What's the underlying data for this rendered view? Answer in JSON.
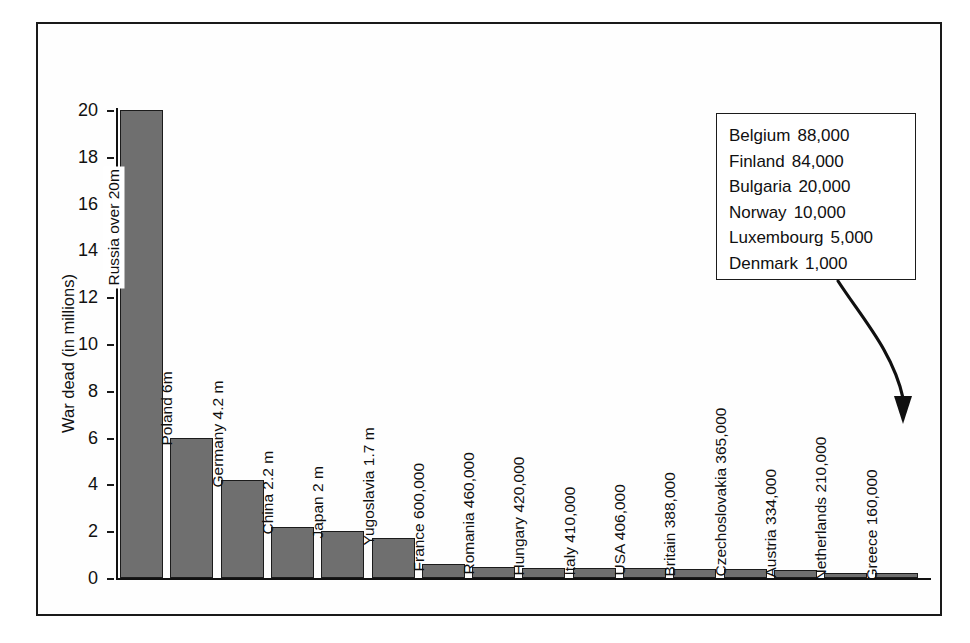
{
  "chart_data": {
    "type": "bar",
    "title": "",
    "xlabel": "",
    "ylabel": "War dead (in millions)",
    "ylim": [
      0,
      20
    ],
    "yticks": [
      0,
      2,
      4,
      6,
      8,
      10,
      12,
      14,
      16,
      18,
      20
    ],
    "ytick_labels": [
      "0",
      "2",
      "4",
      "6",
      "8",
      "10",
      "12",
      "14",
      "16",
      "18",
      "20"
    ],
    "grid": false,
    "legend_position": "none",
    "categories": [
      "Russia",
      "Poland",
      "Germany",
      "China",
      "Japan",
      "Yugoslavia",
      "France",
      "Romania",
      "Hungary",
      "Italy",
      "USA",
      "Britain",
      "Czechoslovakia",
      "Austria",
      "Netherlands",
      "Greece"
    ],
    "values": [
      20,
      6,
      4.2,
      2.2,
      2,
      1.7,
      0.6,
      0.46,
      0.42,
      0.41,
      0.406,
      0.388,
      0.365,
      0.334,
      0.21,
      0.16
    ],
    "bar_labels": [
      "Russia over 20m",
      "Poland 6m",
      "Germany 4.2 m",
      "China 2.2 m",
      "Japan 2 m",
      "Yugoslavia 1.7 m",
      "France 600,000",
      "Romania 460,000",
      "Hungary 420,000",
      "Italy 410,000",
      "USA 406,000",
      "Britain 388,000",
      "Czechoslovakia 365,000",
      "Austria 334,000",
      "Netherlands 210,000",
      "Greece 160,000"
    ],
    "annotations": [
      {
        "type": "callout-box",
        "target": "Greece",
        "entries": [
          {
            "country": "Belgium",
            "value": "88,000"
          },
          {
            "country": "Finland",
            "value": "84,000"
          },
          {
            "country": "Bulgaria",
            "value": "20,000"
          },
          {
            "country": "Norway",
            "value": "10,000"
          },
          {
            "country": "Luxembourg",
            "value": "5,000"
          },
          {
            "country": "Denmark",
            "value": "1,000"
          }
        ]
      }
    ],
    "colors": {
      "bar_fill": "#6f6f6f",
      "bar_stroke": "#1b1b1b",
      "axis": "#111111",
      "frame": "#1a1a1a",
      "background": "#ffffff"
    }
  }
}
